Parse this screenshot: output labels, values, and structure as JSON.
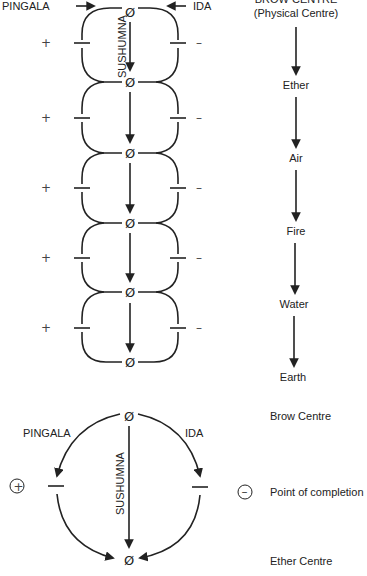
{
  "top_diagram": {
    "left_channel_label": "PINGALA",
    "right_channel_label": "IDA",
    "center_channel_label": "SUSHUMNA",
    "node_symbol": "Ø",
    "plus_sign": "+",
    "minus_sign": "–",
    "node_count": 6,
    "loop_count": 5
  },
  "element_column": {
    "header_line1": "BROW CENTRE",
    "header_line2": "(Physical Centre)",
    "items": [
      "Ether",
      "Air",
      "Fire",
      "Water",
      "Earth"
    ]
  },
  "bottom_diagram": {
    "left_channel_label": "PINGALA",
    "right_channel_label": "IDA",
    "center_channel_label": "SUSHUMNA",
    "node_symbol": "Ø",
    "plus_symbol": "+",
    "minus_symbol": "–",
    "top_label": "Brow Centre",
    "middle_label": "Point of completion",
    "bottom_label": "Ether Centre"
  },
  "colors": {
    "ink": "#222222",
    "background": "#ffffff"
  }
}
